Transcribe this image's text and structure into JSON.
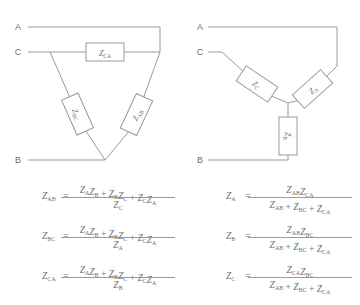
{
  "figure": {
    "background_color": "#ffffff",
    "line_color": "#9a9a9a",
    "text_color": "#6f6f6f"
  },
  "delta_diagram": {
    "name": "delta-network",
    "terminals": [
      {
        "id": "A",
        "label": "A"
      },
      {
        "id": "C",
        "label": "C"
      },
      {
        "id": "B",
        "label": "B"
      }
    ],
    "impedances": [
      {
        "id": "ZCA",
        "base": "Z",
        "sub": "CA",
        "position": "top-branch"
      },
      {
        "id": "ZBC",
        "base": "Z",
        "sub": "BC",
        "position": "left-branch"
      },
      {
        "id": "ZAB",
        "base": "Z",
        "sub": "AB",
        "position": "right-branch"
      }
    ]
  },
  "wye_diagram": {
    "name": "wye-network",
    "terminals": [
      {
        "id": "A",
        "label": "A"
      },
      {
        "id": "C",
        "label": "C"
      },
      {
        "id": "B",
        "label": "B"
      }
    ],
    "impedances": [
      {
        "id": "ZC",
        "base": "Z",
        "sub": "C",
        "position": "left-branch"
      },
      {
        "id": "ZA",
        "base": "Z",
        "sub": "A",
        "position": "right-branch"
      },
      {
        "id": "ZB",
        "base": "Z",
        "sub": "B",
        "position": "bottom-branch"
      }
    ]
  },
  "equations_left": {
    "name": "wye-to-delta-equations",
    "items": [
      {
        "lhs_base": "Z",
        "lhs_sub": "AB",
        "numerator": [
          {
            "b": "Z",
            "s": "A"
          },
          {
            "b": "Z",
            "s": "B"
          },
          {
            "op": "+"
          },
          {
            "b": "Z",
            "s": "B"
          },
          {
            "b": "Z",
            "s": "C"
          },
          {
            "op": "+"
          },
          {
            "b": "Z",
            "s": "C"
          },
          {
            "b": "Z",
            "s": "A"
          }
        ],
        "denominator": [
          {
            "b": "Z",
            "s": "C"
          }
        ]
      },
      {
        "lhs_base": "Z",
        "lhs_sub": "BC",
        "numerator": [
          {
            "b": "Z",
            "s": "A"
          },
          {
            "b": "Z",
            "s": "B"
          },
          {
            "op": "+"
          },
          {
            "b": "Z",
            "s": "B"
          },
          {
            "b": "Z",
            "s": "C"
          },
          {
            "op": "+"
          },
          {
            "b": "Z",
            "s": "C"
          },
          {
            "b": "Z",
            "s": "A"
          }
        ],
        "denominator": [
          {
            "b": "Z",
            "s": "A"
          }
        ]
      },
      {
        "lhs_base": "Z",
        "lhs_sub": "CA",
        "numerator": [
          {
            "b": "Z",
            "s": "A"
          },
          {
            "b": "Z",
            "s": "B"
          },
          {
            "op": "+"
          },
          {
            "b": "Z",
            "s": "B"
          },
          {
            "b": "Z",
            "s": "C"
          },
          {
            "op": "+"
          },
          {
            "b": "Z",
            "s": "C"
          },
          {
            "b": "Z",
            "s": "A"
          }
        ],
        "denominator": [
          {
            "b": "Z",
            "s": "B"
          }
        ]
      }
    ]
  },
  "equations_right": {
    "name": "delta-to-wye-equations",
    "items": [
      {
        "lhs_base": "Z",
        "lhs_sub": "A",
        "numerator": [
          {
            "b": "Z",
            "s": "AB"
          },
          {
            "b": "Z",
            "s": "CA"
          }
        ],
        "denominator": [
          {
            "b": "Z",
            "s": "AB"
          },
          {
            "op": "+"
          },
          {
            "b": "Z",
            "s": "BC"
          },
          {
            "op": "+"
          },
          {
            "b": "Z",
            "s": "CA"
          }
        ]
      },
      {
        "lhs_base": "Z",
        "lhs_sub": "B",
        "numerator": [
          {
            "b": "Z",
            "s": "AB"
          },
          {
            "b": "Z",
            "s": "BC"
          }
        ],
        "denominator": [
          {
            "b": "Z",
            "s": "AB"
          },
          {
            "op": "+"
          },
          {
            "b": "Z",
            "s": "BC"
          },
          {
            "op": "+"
          },
          {
            "b": "Z",
            "s": "CA"
          }
        ]
      },
      {
        "lhs_base": "Z",
        "lhs_sub": "C",
        "numerator": [
          {
            "b": "Z",
            "s": "CA"
          },
          {
            "b": "Z",
            "s": "BC"
          }
        ],
        "denominator": [
          {
            "b": "Z",
            "s": "AB"
          },
          {
            "op": "+"
          },
          {
            "b": "Z",
            "s": "BC"
          },
          {
            "op": "+"
          },
          {
            "b": "Z",
            "s": "CA"
          }
        ]
      }
    ]
  },
  "equals_sign": "="
}
